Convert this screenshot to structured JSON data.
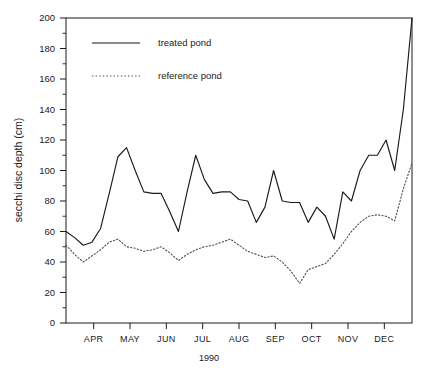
{
  "chart_data": {
    "type": "line",
    "title": "",
    "xlabel": "1990",
    "ylabel": "secchi disc depth (cm)",
    "ylim": [
      0,
      200
    ],
    "ytick_values": [
      0,
      20,
      40,
      60,
      80,
      100,
      120,
      140,
      160,
      180,
      200
    ],
    "ytick_labels": [
      "0",
      "20",
      "40",
      "60",
      "80",
      "100",
      "120",
      "140",
      "160",
      "180",
      "200"
    ],
    "yminor_step": 10,
    "xlim": [
      0,
      40
    ],
    "categories": [
      "APR",
      "MAY",
      "JUN",
      "JUL",
      "AUG",
      "SEP",
      "OCT",
      "NOV",
      "DEC"
    ],
    "xtick_positions": [
      3.2,
      7.4,
      11.6,
      15.8,
      20.0,
      24.2,
      28.4,
      32.6,
      36.8
    ],
    "grid": false,
    "legend_position": "upper-left",
    "series": [
      {
        "name": "treated pond",
        "style": "solid",
        "color": "#1a1a1a",
        "x": [
          0.0,
          1.0,
          2.0,
          3.0,
          4.0,
          5.0,
          6.0,
          7.0,
          8.0,
          9.0,
          10.0,
          11.0,
          12.0,
          13.0,
          14.0,
          15.0,
          16.0,
          17.0,
          18.0,
          19.0,
          20.0,
          21.0,
          22.0,
          23.0,
          24.0,
          25.0,
          26.0,
          27.0,
          28.0,
          29.0,
          30.0,
          31.0,
          32.0,
          33.0,
          34.0,
          35.0,
          36.0,
          37.0,
          38.0,
          39.0,
          40.0
        ],
        "values": [
          60,
          56,
          51,
          53,
          62,
          85,
          109,
          115,
          100,
          86,
          85,
          85,
          73,
          60,
          86,
          110,
          94,
          85,
          86,
          86,
          81,
          80,
          66,
          76,
          100,
          80,
          79,
          79,
          66,
          76,
          70,
          55,
          86,
          80,
          100,
          110,
          110,
          120,
          100,
          140,
          200
        ]
      },
      {
        "name": "reference pond",
        "style": "dotted",
        "color": "#4d4d4d",
        "x": [
          0.0,
          1.0,
          2.0,
          3.0,
          4.0,
          5.0,
          6.0,
          7.0,
          8.0,
          9.0,
          10.0,
          11.0,
          12.0,
          13.0,
          14.0,
          15.0,
          16.0,
          17.0,
          18.0,
          19.0,
          20.0,
          21.0,
          22.0,
          23.0,
          24.0,
          25.0,
          26.0,
          27.0,
          28.0,
          29.0,
          30.0,
          31.0,
          32.0,
          33.0,
          34.0,
          35.0,
          36.0,
          37.0,
          38.0,
          39.0,
          40.0
        ],
        "values": [
          51,
          45,
          40,
          44,
          48,
          53,
          55,
          50,
          49,
          47,
          48,
          50,
          46,
          41,
          45,
          48,
          50,
          51,
          53,
          55,
          51,
          47,
          45,
          43,
          44,
          40,
          34,
          26,
          35,
          37,
          39,
          45,
          52,
          60,
          66,
          70,
          71,
          70,
          67,
          88,
          105
        ]
      }
    ]
  },
  "legend": {
    "entries": [
      {
        "label": "treated pond",
        "style": "solid"
      },
      {
        "label": "reference pond",
        "style": "dotted"
      }
    ]
  }
}
